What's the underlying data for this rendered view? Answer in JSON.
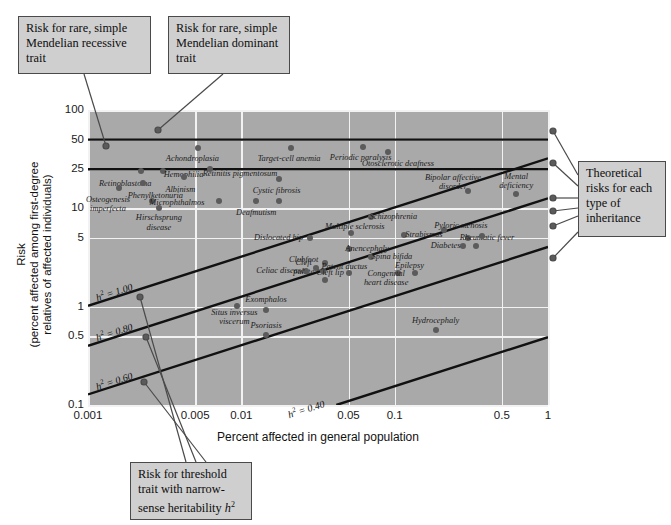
{
  "chart_data": {
    "type": "scatter",
    "title": "",
    "xlabel": "Percent affected in general population",
    "ylabel_lines": [
      "Risk",
      "(percent affected among first-degree",
      "relatives of affected individuals)"
    ],
    "xscale": "log",
    "yscale": "log",
    "xlim": [
      0.001,
      1
    ],
    "ylim": [
      0.1,
      100
    ],
    "xticks": [
      "0.001",
      "0.005",
      "0.01",
      "0.05",
      "0.1",
      "0.5",
      "1"
    ],
    "xtick_values": [
      0.001,
      0.005,
      0.01,
      0.05,
      0.1,
      0.5,
      1
    ],
    "yticks": [
      "0.1",
      "0.5",
      "1",
      "5",
      "10",
      "25",
      "50",
      "100"
    ],
    "ytick_values": [
      0.1,
      0.5,
      1,
      5,
      10,
      25,
      50,
      100
    ],
    "grid": true,
    "gridcolor": "#f2f2f2",
    "plot_background": "#a9a9a9",
    "point_color": "#5b5b5b",
    "reference_lines": [
      {
        "name": "dominant",
        "label": "",
        "type": "horizontal",
        "y": 50
      },
      {
        "name": "recessive",
        "label": "",
        "type": "horizontal",
        "y": 25
      },
      {
        "name": "h2-1.00",
        "label": "h² = 1.00",
        "type": "sloped",
        "slope": 0.5
      },
      {
        "name": "h2-0.80",
        "label": "h² = 0.80",
        "type": "sloped",
        "slope": 0.5
      },
      {
        "name": "h2-0.60",
        "label": "h² = 0.60",
        "type": "sloped",
        "slope": 0.5
      },
      {
        "name": "h2-0.40",
        "label": "h² = 0.40",
        "type": "sloped",
        "slope": 0.5
      }
    ],
    "points": [
      {
        "label": "Retinoblastoma",
        "x": 0.0022,
        "y": 24,
        "lx": 0.00175,
        "ly": 17.5
      },
      {
        "label": "Osteogenesis\nimperfecta",
        "x": 0.0016,
        "y": 16,
        "lx": 0.00135,
        "ly": 11.0
      },
      {
        "label": "Phenylketonuria",
        "x": 0.0023,
        "y": 18,
        "lx": 0.00275,
        "ly": 13.2
      },
      {
        "label": "Hemophilia",
        "x": 0.0031,
        "y": 24,
        "lx": 0.0042,
        "ly": 22.0
      },
      {
        "label": "Albinism",
        "x": 0.0042,
        "y": 21,
        "lx": 0.004,
        "ly": 15.5
      },
      {
        "label": "Microphthalmos",
        "x": 0.0026,
        "y": 12,
        "lx": 0.0038,
        "ly": 11.3
      },
      {
        "label": "Hirschsprung\ndisease",
        "x": 0.0029,
        "y": 10,
        "lx": 0.0029,
        "ly": 7.2
      },
      {
        "label": "Achondroplasia",
        "x": 0.0052,
        "y": 41,
        "lx": 0.0048,
        "ly": 32.0
      },
      {
        "label": "Retinitis pigmentosum",
        "x": 0.0062,
        "y": 25,
        "lx": 0.0098,
        "ly": 22.5
      },
      {
        "label": "Target-cell anemia",
        "x": 0.021,
        "y": 41,
        "lx": 0.0205,
        "ly": 32.0
      },
      {
        "label": "Periodic paralysis",
        "x": 0.062,
        "y": 42,
        "lx": 0.06,
        "ly": 32.5
      },
      {
        "label": "Otosclerotic deafness",
        "x": 0.09,
        "y": 37,
        "lx": 0.105,
        "ly": 28.5
      },
      {
        "label": "Cystic fibrosis",
        "x": 0.0175,
        "y": 20,
        "lx": 0.017,
        "ly": 15.0
      },
      {
        "label": "Deafmutism",
        "x": 0.0125,
        "y": 12,
        "lx": 0.0125,
        "ly": 9.0
      },
      {
        "label": "",
        "x": 0.0175,
        "y": 12,
        "lx": 0,
        "ly": 0
      },
      {
        "label": "",
        "x": 0.0072,
        "y": 12,
        "lx": 0,
        "ly": 0
      },
      {
        "label": "Bipolar affective\ndisorder",
        "x": 0.3,
        "y": 15,
        "lx": 0.24,
        "ly": 18.5
      },
      {
        "label": "Mental\ndeficiency",
        "x": 0.62,
        "y": 14,
        "lx": 0.62,
        "ly": 19.0
      },
      {
        "label": "Schizophrenia",
        "x": 0.07,
        "y": 8.2,
        "lx": 0.098,
        "ly": 8.2
      },
      {
        "label": "Multiple sclerosis",
        "x": 0.052,
        "y": 5.6,
        "lx": 0.055,
        "ly": 6.5
      },
      {
        "label": "Pyloric stenosis",
        "x": 0.21,
        "y": 6.0,
        "lx": 0.27,
        "ly": 6.6
      },
      {
        "label": "Strabismus",
        "x": 0.115,
        "y": 5.3,
        "lx": 0.155,
        "ly": 5.3
      },
      {
        "label": "Dislocated hip",
        "x": 0.028,
        "y": 5.0,
        "lx": 0.0175,
        "ly": 5.0
      },
      {
        "label": "Rheumatic fever",
        "x": 0.3,
        "y": 5.0,
        "lx": 0.4,
        "ly": 5.0
      },
      {
        "label": "",
        "x": 0.37,
        "y": 5.2,
        "lx": 0,
        "ly": 0
      },
      {
        "label": "Anencephaly",
        "x": 0.05,
        "y": 3.9,
        "lx": 0.066,
        "ly": 3.9
      },
      {
        "label": "Diabetes",
        "x": 0.28,
        "y": 4.1,
        "lx": 0.215,
        "ly": 4.1
      },
      {
        "label": "",
        "x": 0.34,
        "y": 4.1,
        "lx": 0,
        "ly": 0
      },
      {
        "label": "Spina bifida",
        "x": 0.07,
        "y": 3.2,
        "lx": 0.096,
        "ly": 3.2
      },
      {
        "label": "Clubfoot",
        "x": 0.035,
        "y": 2.8,
        "lx": 0.0255,
        "ly": 3.0
      },
      {
        "label": "Cleft\npalate",
        "x": 0.0305,
        "y": 2.5,
        "lx": 0.0255,
        "ly": 2.55
      },
      {
        "label": "Patent ductus",
        "x": 0.034,
        "y": 2.3,
        "lx": 0.047,
        "ly": 2.55
      },
      {
        "label": "Celiac disease",
        "x": 0.0265,
        "y": 2.3,
        "lx": 0.018,
        "ly": 2.3
      },
      {
        "label": "Cleft lip",
        "x": 0.05,
        "y": 2.2,
        "lx": 0.038,
        "ly": 2.2
      },
      {
        "label": "Congenital\nheart disease",
        "x": 0.105,
        "y": 2.2,
        "lx": 0.088,
        "ly": 1.95
      },
      {
        "label": "Epilepsy",
        "x": 0.135,
        "y": 2.2,
        "lx": 0.125,
        "ly": 2.6
      },
      {
        "label": "",
        "x": 0.035,
        "y": 1.85,
        "lx": 0,
        "ly": 0
      },
      {
        "label": "Exomphalos",
        "x": 0.0145,
        "y": 0.92,
        "lx": 0.0145,
        "ly": 1.18
      },
      {
        "label": "Situs inversus\nviscerum",
        "x": 0.0093,
        "y": 1.02,
        "lx": 0.009,
        "ly": 0.78
      },
      {
        "label": "Psoriasis",
        "x": 0.0145,
        "y": 0.52,
        "lx": 0.0145,
        "ly": 0.64
      },
      {
        "label": "Hydrocephaly",
        "x": 0.185,
        "y": 0.58,
        "lx": 0.185,
        "ly": 0.72
      }
    ]
  },
  "callouts": {
    "recessive": "Risk for rare, simple Mendelian recessive trait",
    "dominant": "Risk for rare, simple Mendelian dominant trait",
    "theoretical": "Theoretical risks for each type of inheritance",
    "threshold_line1": "Risk for threshold",
    "threshold_line2": "trait with narrow-",
    "threshold_line3_pre": "sense heritability ",
    "threshold_line3_italic": "h",
    "threshold_line3_sup": "2"
  },
  "caption": ""
}
